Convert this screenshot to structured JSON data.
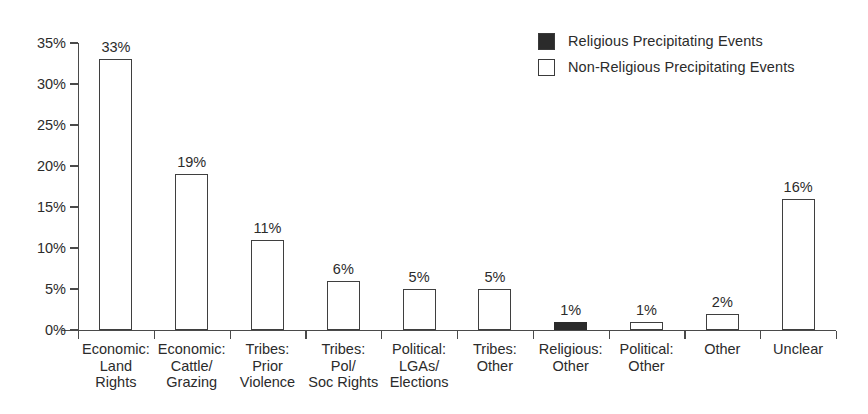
{
  "chart_data": {
    "type": "bar",
    "title": "",
    "xlabel": "",
    "ylabel": "",
    "ylim": [
      0,
      35
    ],
    "grid": false,
    "legend_position": "top-right",
    "ytick_labels": [
      "35%",
      "30%",
      "25%",
      "20%",
      "15%",
      "10%",
      "5%",
      "0%"
    ],
    "ytick_values": [
      35,
      30,
      25,
      20,
      15,
      10,
      5,
      0
    ],
    "categories": [
      "Economic:\nLand\nRights",
      "Economic:\nCattle/\nGrazing",
      "Tribes:\nPrior\nViolence",
      "Tribes:\nPol/\nSoc Rights",
      "Political:\nLGAs/\nElections",
      "Tribes:\nOther",
      "Religious:\nOther",
      "Political:\nOther",
      "Other",
      "Unclear"
    ],
    "values": [
      33,
      19,
      11,
      6,
      5,
      5,
      1,
      1,
      2,
      16
    ],
    "value_labels": [
      "33%",
      "19%",
      "11%",
      "6%",
      "5%",
      "5%",
      "1%",
      "1%",
      "2%",
      "16%"
    ],
    "bar_kinds": [
      "non-religious",
      "non-religious",
      "non-religious",
      "non-religious",
      "non-religious",
      "non-religious",
      "religious",
      "non-religious",
      "non-religious",
      "non-religious"
    ],
    "series": [
      {
        "name": "Religious Precipitating Events",
        "swatch": "filled",
        "color": "#2b2b2b",
        "values": [
          null,
          null,
          null,
          null,
          null,
          null,
          1,
          null,
          null,
          null
        ]
      },
      {
        "name": "Non-Religious Precipitating Events",
        "swatch": "hollow",
        "color": "#ffffff",
        "values": [
          33,
          19,
          11,
          6,
          5,
          5,
          null,
          1,
          2,
          16
        ]
      }
    ]
  },
  "legend": {
    "items": [
      {
        "label": "Religious Precipitating Events",
        "swatch": "filled"
      },
      {
        "label": "Non-Religious Precipitating Events",
        "swatch": "hollow"
      }
    ]
  },
  "colors": {
    "axis": "#4a4a4a",
    "bar_outline": "#3f3f3f",
    "bar_fill_religious": "#2b2b2b",
    "bar_fill_non_religious": "#ffffff",
    "text": "#2b2b2b",
    "background": "#ffffff"
  }
}
